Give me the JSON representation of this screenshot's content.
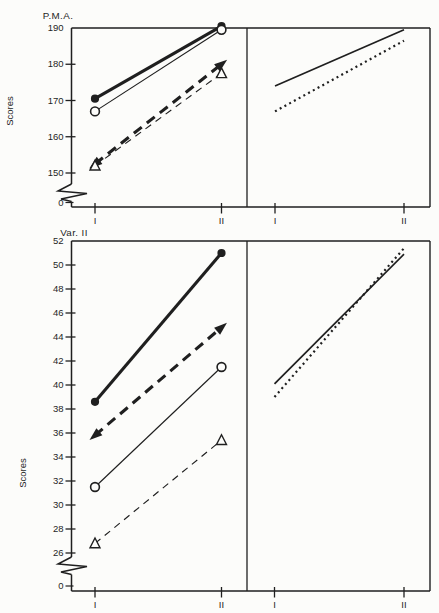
{
  "page": {
    "background": "#fcfcfa",
    "ink": "#1f1f1f"
  },
  "chart_data": [
    {
      "id": "pma",
      "type": "line",
      "title": "P.M.A.",
      "ylabel": "Scores",
      "x_categories": [
        "I",
        "II"
      ],
      "yticks": [
        190,
        180,
        170,
        160,
        150
      ],
      "axis_break_label": "0",
      "ylim": [
        150,
        190
      ],
      "grid": false,
      "legend": "none",
      "panels": [
        {
          "name": "left-observed",
          "series": [
            {
              "name": "filled-circle-solid-thick",
              "marker": "filled-circle",
              "line": "solid",
              "weight": "thick",
              "values": [
                170.5,
                190.5
              ]
            },
            {
              "name": "open-circle-solid-thin",
              "marker": "open-circle",
              "line": "solid",
              "weight": "thin",
              "values": [
                167,
                189.5
              ]
            },
            {
              "name": "filled-triangle-dashed-thick",
              "marker": "filled-arrow",
              "line": "dashed",
              "weight": "thick",
              "values": [
                152.5,
                180
              ]
            },
            {
              "name": "open-triangle-dashed-thin",
              "marker": "open-triangle",
              "line": "dashed",
              "weight": "thin",
              "values": [
                152,
                177.5
              ]
            }
          ]
        },
        {
          "name": "right-summary",
          "series": [
            {
              "name": "solid-line",
              "marker": "none",
              "line": "solid",
              "weight": "medium",
              "values": [
                174,
                189.5
              ]
            },
            {
              "name": "dotted-line",
              "marker": "none",
              "line": "dotted",
              "weight": "medium",
              "values": [
                167,
                186.5
              ]
            }
          ]
        }
      ]
    },
    {
      "id": "var2",
      "type": "line",
      "title": "Var. II",
      "ylabel": "Scores",
      "x_categories": [
        "I",
        "II"
      ],
      "yticks": [
        52,
        50,
        48,
        46,
        44,
        42,
        40,
        38,
        36,
        34,
        32,
        30,
        28,
        26
      ],
      "axis_break_label": "0",
      "ylim": [
        26,
        52
      ],
      "grid": false,
      "legend": "none",
      "panels": [
        {
          "name": "left-observed",
          "series": [
            {
              "name": "filled-circle-solid-thick",
              "marker": "filled-circle",
              "line": "solid",
              "weight": "thick",
              "values": [
                38.6,
                51
              ]
            },
            {
              "name": "filled-triangle-dashed-thick",
              "marker": "filled-arrow",
              "line": "dashed",
              "weight": "thick",
              "values": [
                35.8,
                44.8
              ]
            },
            {
              "name": "open-circle-solid-thin",
              "marker": "open-circle",
              "line": "solid",
              "weight": "thin",
              "values": [
                31.5,
                41.5
              ]
            },
            {
              "name": "open-triangle-dashed-thin",
              "marker": "open-triangle",
              "line": "dashed",
              "weight": "thin",
              "values": [
                26.8,
                35.4
              ]
            }
          ]
        },
        {
          "name": "right-summary",
          "series": [
            {
              "name": "solid-line",
              "marker": "none",
              "line": "solid",
              "weight": "medium",
              "values": [
                40.1,
                50.9
              ]
            },
            {
              "name": "dotted-line",
              "marker": "none",
              "line": "dotted",
              "weight": "medium",
              "values": [
                39.0,
                51.4
              ]
            }
          ]
        }
      ]
    }
  ]
}
